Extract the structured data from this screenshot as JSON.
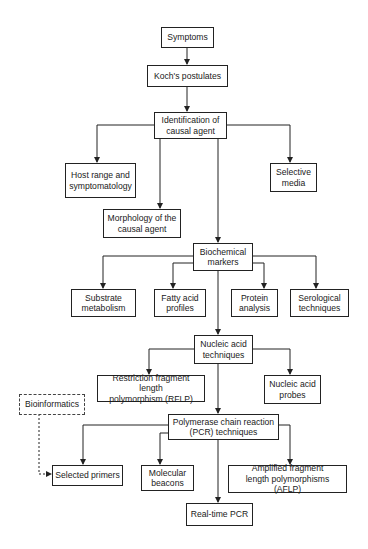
{
  "diagram": {
    "page_fragment": "",
    "nodes": {
      "symptoms": "Symptoms",
      "kochs_postulates": "Koch's postulates",
      "identification": "Identification of\ncausal agent",
      "host_range": "Host range and\nsymptomatology",
      "morphology": "Morphology of the\ncausal agent",
      "selective_media": "Selective\nmedia",
      "biochemical_markers": "Biochemical\nmarkers",
      "substrate_metabolism": "Substrate\nmetabolism",
      "fatty_acid_profiles": "Fatty acid\nprofiles",
      "protein_analysis": "Protein\nanalysis",
      "serological_techniques": "Serological\ntechniques",
      "nucleic_acid_techniques": "Nucleic acid\ntechniques",
      "rflp": "Restriction fragment length\npolymorphism (RFLP)",
      "nucleic_acid_probes": "Nucleic acid\nprobes",
      "bioinformatics": "Bioinformatics",
      "pcr_techniques": "Polymerase chain reaction\n(PCR) techniques",
      "selected_primers": "Selected primers",
      "molecular_beacons": "Molecular\nbeacons",
      "aflp": "Amplified fragment\nlength polymorphisms (AFLP)",
      "real_time_pcr": "Real-time PCR"
    },
    "edges": [
      {
        "from": "symptoms",
        "to": "kochs_postulates",
        "style": "solid"
      },
      {
        "from": "kochs_postulates",
        "to": "identification",
        "style": "solid"
      },
      {
        "from": "identification",
        "to": "host_range",
        "style": "solid"
      },
      {
        "from": "identification",
        "to": "morphology",
        "style": "solid"
      },
      {
        "from": "identification",
        "to": "selective_media",
        "style": "solid"
      },
      {
        "from": "identification",
        "to": "biochemical_markers",
        "style": "solid"
      },
      {
        "from": "biochemical_markers",
        "to": "substrate_metabolism",
        "style": "solid"
      },
      {
        "from": "biochemical_markers",
        "to": "fatty_acid_profiles",
        "style": "solid"
      },
      {
        "from": "biochemical_markers",
        "to": "protein_analysis",
        "style": "solid"
      },
      {
        "from": "biochemical_markers",
        "to": "serological_techniques",
        "style": "solid"
      },
      {
        "from": "biochemical_markers",
        "to": "nucleic_acid_techniques",
        "style": "solid"
      },
      {
        "from": "nucleic_acid_techniques",
        "to": "rflp",
        "style": "solid"
      },
      {
        "from": "nucleic_acid_techniques",
        "to": "nucleic_acid_probes",
        "style": "solid"
      },
      {
        "from": "nucleic_acid_techniques",
        "to": "pcr_techniques",
        "style": "solid"
      },
      {
        "from": "pcr_techniques",
        "to": "selected_primers",
        "style": "solid"
      },
      {
        "from": "pcr_techniques",
        "to": "molecular_beacons",
        "style": "solid"
      },
      {
        "from": "pcr_techniques",
        "to": "aflp",
        "style": "solid"
      },
      {
        "from": "pcr_techniques",
        "to": "real_time_pcr",
        "style": "solid"
      },
      {
        "from": "bioinformatics",
        "to": "selected_primers",
        "style": "dashed"
      }
    ],
    "colors": {
      "stroke": "#222222",
      "background": "#ffffff",
      "text": "#1a1a1a"
    }
  }
}
